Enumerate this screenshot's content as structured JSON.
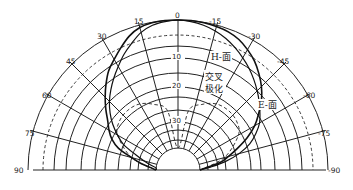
{
  "chart_data": {
    "type": "polar",
    "title": "",
    "angle_unit": "deg",
    "angle_ticks": [
      90,
      75,
      60,
      45,
      30,
      15,
      0,
      -15,
      -30,
      -45,
      -60,
      -75,
      -90
    ],
    "angle_tick_labels": [
      "90",
      "75",
      "60",
      "45",
      "30",
      "15",
      "0",
      "-15",
      "-30",
      "-45",
      "-60",
      "-75",
      "-90"
    ],
    "radial_unit": "dB (relative)",
    "radial_tick_labels": [
      "0",
      "10",
      "20",
      "30"
    ],
    "radial_ticks_db": [
      0,
      -10,
      -20,
      -30
    ],
    "rings_db": [
      0,
      -3,
      -6,
      -10,
      -15,
      -20,
      -23,
      -27,
      -30,
      -33,
      -37,
      -40
    ],
    "dashed_ring_db": -3,
    "grid": true,
    "series": [
      {
        "name": "H-面",
        "style": "solid-thick",
        "angles": [
          -90,
          -80,
          -75,
          -70,
          -65,
          -60,
          -55,
          -50,
          -45,
          -40,
          -35,
          -30,
          -25,
          -20,
          -15,
          -10,
          -5,
          0,
          5,
          10,
          15,
          20,
          25,
          30,
          35,
          40,
          45,
          50,
          55,
          60,
          65,
          70,
          75,
          80,
          85,
          90
        ],
        "values_db": [
          -40,
          -32,
          -29,
          -26,
          -22,
          -18,
          -14.5,
          -11,
          -8,
          -5.5,
          -3.5,
          -2.2,
          -1.2,
          -0.6,
          -0.3,
          -0.1,
          0,
          0,
          0,
          -0.1,
          -0.5,
          -1.5,
          -3,
          -5,
          -7,
          -10,
          -13,
          -16,
          -19,
          -21,
          -23,
          -26,
          -30,
          -34,
          -38,
          -40
        ]
      },
      {
        "name": "E-面",
        "style": "solid",
        "angles": [
          -90,
          -85,
          -80,
          -75,
          -70,
          -65,
          -60,
          -55,
          -50,
          -45,
          -40,
          -35,
          -30,
          -25,
          -20,
          -15,
          -10,
          -5,
          0,
          5,
          10,
          15,
          20,
          25,
          30,
          35,
          40,
          45,
          50,
          55,
          60,
          65,
          70,
          75,
          80,
          85,
          90
        ],
        "values_db": [
          -40,
          -36,
          -30,
          -26,
          -22,
          -19,
          -16,
          -14,
          -12,
          -10,
          -8,
          -6,
          -4.5,
          -3,
          -2,
          -1.2,
          -0.6,
          -0.2,
          0,
          -0.2,
          -0.6,
          -1.5,
          -3,
          -5,
          -7.5,
          -10,
          -12.5,
          -15,
          -18,
          -21,
          -24,
          -27,
          -31,
          -35,
          -38,
          -40,
          -40
        ]
      },
      {
        "name": "交叉极化",
        "style": "dashed",
        "angles": [
          -90,
          -75,
          -60,
          -50,
          -40,
          -30,
          -20,
          -10,
          0,
          10,
          20,
          30,
          40,
          50,
          60,
          75,
          90
        ],
        "values_db": [
          -40,
          -30,
          -24,
          -22,
          -21.5,
          -22,
          -24,
          -27,
          -40,
          -27,
          -24,
          -22,
          -21.5,
          -22,
          -24,
          -30,
          -40
        ]
      }
    ],
    "annotations": [
      {
        "text": "H-面",
        "target": "H-plane curve"
      },
      {
        "text": "交叉",
        "target": "cross-polarization curve line 1"
      },
      {
        "text": "极化",
        "target": "cross-polarization curve line 2"
      },
      {
        "text": "E-面",
        "target": "E-plane curve"
      }
    ]
  },
  "labels": {
    "a90": "90",
    "a75": "75",
    "a60": "60",
    "a45": "45",
    "a30": "30",
    "a15": "15",
    "a0": "0",
    "am15": "-15",
    "am30": "-30",
    "am45": "-45",
    "am60": "-60",
    "am75": "-75",
    "am90": "-90",
    "r10": "10",
    "r20": "20",
    "r30": "30",
    "h_plane": "H-面",
    "cross_1": "交叉",
    "cross_2": "极化",
    "e_plane": "E-面"
  }
}
